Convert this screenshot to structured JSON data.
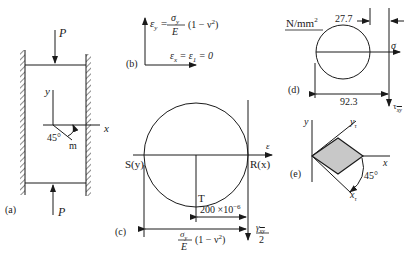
{
  "panels": {
    "a": {
      "label": "(a)",
      "load_top": "P",
      "load_bottom": "P",
      "axis_y": "y",
      "axis_x": "x",
      "angle": "45°",
      "line_label": "m"
    },
    "b": {
      "label": "(b)",
      "eq_y_lhs": "ε",
      "eq_y_sub": "y",
      "eq_y_eq": "=",
      "eq_y_num": "σ",
      "eq_y_num_sub": "y",
      "eq_y_den": "E",
      "eq_y_factor": "(1 − ν",
      "eq_y_exp": "2",
      "eq_y_close": ")",
      "eq_x": "ε",
      "eq_x_sub": "x",
      "eq_x_rest": " = ε",
      "eq_x_sub2": "1",
      "eq_x_end": " = 0"
    },
    "c": {
      "label": "(c)",
      "axis_label": "ε",
      "point_s": "S(y)",
      "point_r": "R(x)",
      "point_t": "T",
      "dim_radius": "200 ×10",
      "dim_radius_exp": "−6",
      "dim_total_num": "σ",
      "dim_total_num_sub": "y",
      "dim_total_den": "E",
      "dim_total_factor": "(1 − ν",
      "dim_total_exp": "2",
      "dim_total_close": ")",
      "gamma_num": "γ",
      "gamma_sub": "xy",
      "gamma_den": "2"
    },
    "d": {
      "label": "(d)",
      "units": "N/mm",
      "units_exp": "2",
      "dim_small": "27.7",
      "dim_large": "92.3",
      "axis_sigma": "σ",
      "axis_tau": "τ",
      "axis_tau_sub": "xy"
    },
    "e": {
      "label": "(e)",
      "axis_y": "y",
      "axis_x": "x",
      "axis_yt": "y",
      "axis_yt_sub": "τ",
      "axis_xt": "x",
      "axis_xt_sub": "τ",
      "angle": "45°"
    }
  },
  "colors": {
    "ink": "#1a1a1a",
    "element_fill": "#c8c8c8"
  }
}
